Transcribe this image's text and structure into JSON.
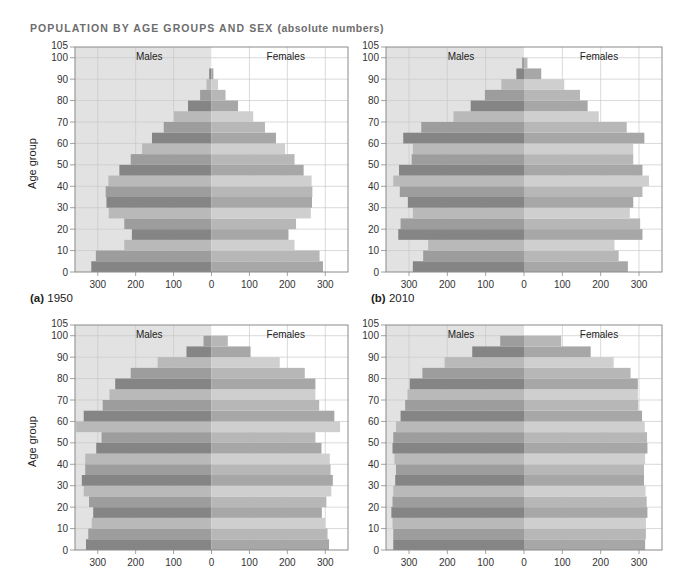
{
  "title": {
    "main": "POPULATION BY AGE GROUPS AND SEX",
    "sub": "(absolute numbers)"
  },
  "panel_labels": [
    {
      "letter": "(a)",
      "year": "1950"
    },
    {
      "letter": "(b)",
      "year": "2010"
    }
  ],
  "colors": {
    "male_bg": "#e2e2e2",
    "female_bg": "#ffffff",
    "grid": "#c9c9c9",
    "axis": "#8a8a8a",
    "male": [
      "#858585",
      "#9d9d9d",
      "#b9b9b9"
    ],
    "female": [
      "#a7a7a7",
      "#b7b7b7",
      "#cfcfcf"
    ]
  },
  "chart_data": [
    {
      "type": "bar",
      "subtype": "population-pyramid",
      "title": "POPULATION BY AGE GROUPS AND SEX (absolute numbers)",
      "panel": "(a) 1950",
      "ylabel": "Age group",
      "xlabel": "",
      "legend": [
        "Males",
        "Females"
      ],
      "xlim": [
        -360,
        360
      ],
      "ylim": [
        0,
        105
      ],
      "xticks": [
        -300,
        -200,
        -100,
        0,
        100,
        200,
        300
      ],
      "xtick_labels": [
        "300",
        "200",
        "100",
        "0",
        "100",
        "200",
        "300"
      ],
      "yticks": [
        0,
        10,
        20,
        30,
        40,
        50,
        60,
        70,
        80,
        90,
        100,
        105
      ],
      "grid": true,
      "categories": [
        "0-4",
        "5-9",
        "10-14",
        "15-19",
        "20-24",
        "25-29",
        "30-34",
        "35-39",
        "40-44",
        "45-49",
        "50-54",
        "55-59",
        "60-64",
        "65-69",
        "70-74",
        "75-79",
        "80-84",
        "85-89",
        "90-94",
        "95-99"
      ],
      "series": [
        {
          "name": "Males",
          "values": [
            317,
            305,
            230,
            210,
            230,
            271,
            277,
            279,
            272,
            243,
            213,
            183,
            157,
            126,
            99,
            62,
            30,
            13,
            6,
            0
          ]
        },
        {
          "name": "Females",
          "values": [
            294,
            285,
            219,
            203,
            223,
            262,
            265,
            266,
            264,
            243,
            219,
            194,
            170,
            141,
            110,
            70,
            37,
            17,
            5,
            0
          ]
        }
      ]
    },
    {
      "type": "bar",
      "subtype": "population-pyramid",
      "title": "POPULATION BY AGE GROUPS AND SEX (absolute numbers)",
      "panel": "(b) 2010",
      "ylabel": "",
      "xlabel": "",
      "legend": [
        "Males",
        "Females"
      ],
      "xlim": [
        -360,
        360
      ],
      "ylim": [
        0,
        105
      ],
      "xticks": [
        -300,
        -200,
        -100,
        0,
        100,
        200,
        300
      ],
      "xtick_labels": [
        "300",
        "200",
        "100",
        "0",
        "100",
        "200",
        "300"
      ],
      "yticks": [
        0,
        10,
        20,
        30,
        40,
        50,
        60,
        70,
        80,
        90,
        100,
        105
      ],
      "grid": true,
      "categories": [
        "0-4",
        "5-9",
        "10-14",
        "15-19",
        "20-24",
        "25-29",
        "30-34",
        "35-39",
        "40-44",
        "45-49",
        "50-54",
        "55-59",
        "60-64",
        "65-69",
        "70-74",
        "75-79",
        "80-84",
        "85-89",
        "90-94",
        "95-99"
      ],
      "series": [
        {
          "name": "Males",
          "values": [
            290,
            263,
            250,
            328,
            322,
            290,
            303,
            324,
            341,
            326,
            293,
            290,
            315,
            268,
            184,
            139,
            102,
            59,
            20,
            5
          ]
        },
        {
          "name": "Females",
          "values": [
            271,
            247,
            236,
            309,
            303,
            276,
            285,
            309,
            326,
            309,
            285,
            285,
            314,
            268,
            195,
            166,
            146,
            105,
            45,
            9
          ]
        }
      ]
    },
    {
      "type": "bar",
      "subtype": "population-pyramid",
      "panel": "lower-left",
      "ylabel": "Age group",
      "xlabel": "",
      "legend": [
        "Males",
        "Females"
      ],
      "xlim": [
        -360,
        360
      ],
      "ylim": [
        0,
        105
      ],
      "xticks": [
        -300,
        -200,
        -100,
        0,
        100,
        200,
        300
      ],
      "xtick_labels": [
        "300",
        "200",
        "100",
        "0",
        "100",
        "200",
        "300"
      ],
      "yticks": [
        0,
        10,
        20,
        30,
        40,
        50,
        60,
        70,
        80,
        90,
        100,
        105
      ],
      "grid": true,
      "categories": [
        "0-4",
        "5-9",
        "10-14",
        "15-19",
        "20-24",
        "25-29",
        "30-34",
        "35-39",
        "40-44",
        "45-49",
        "50-54",
        "55-59",
        "60-64",
        "65-69",
        "70-74",
        "75-79",
        "80-84",
        "85-89",
        "90-94",
        "95-99"
      ],
      "series": [
        {
          "name": "Males",
          "values": [
            331,
            325,
            316,
            312,
            323,
            337,
            342,
            333,
            333,
            304,
            290,
            357,
            337,
            287,
            269,
            254,
            213,
            142,
            66,
            21
          ]
        },
        {
          "name": "Females",
          "values": [
            310,
            306,
            300,
            291,
            303,
            316,
            320,
            314,
            312,
            290,
            274,
            339,
            324,
            284,
            274,
            274,
            246,
            180,
            103,
            43
          ]
        }
      ]
    },
    {
      "type": "bar",
      "subtype": "population-pyramid",
      "panel": "lower-right",
      "ylabel": "",
      "xlabel": "",
      "legend": [
        "Males",
        "Females"
      ],
      "xlim": [
        -360,
        360
      ],
      "ylim": [
        0,
        105
      ],
      "xticks": [
        -300,
        -200,
        -100,
        0,
        100,
        200,
        300
      ],
      "xtick_labels": [
        "300",
        "200",
        "100",
        "0",
        "100",
        "200",
        "300"
      ],
      "yticks": [
        0,
        10,
        20,
        30,
        40,
        50,
        60,
        70,
        80,
        90,
        100,
        105
      ],
      "grid": true,
      "categories": [
        "0-4",
        "5-9",
        "10-14",
        "15-19",
        "20-24",
        "25-29",
        "30-34",
        "35-39",
        "40-44",
        "45-49",
        "50-54",
        "55-59",
        "60-64",
        "65-69",
        "70-74",
        "75-79",
        "80-84",
        "85-89",
        "90-94",
        "95-99"
      ],
      "series": [
        {
          "name": "Males",
          "values": [
            341,
            341,
            343,
            346,
            343,
            341,
            336,
            334,
            338,
            343,
            341,
            334,
            322,
            310,
            304,
            298,
            265,
            207,
            135,
            62
          ]
        },
        {
          "name": "Females",
          "values": [
            316,
            318,
            318,
            322,
            320,
            317,
            313,
            313,
            316,
            322,
            321,
            315,
            308,
            298,
            297,
            297,
            278,
            234,
            174,
            97
          ]
        }
      ]
    }
  ]
}
